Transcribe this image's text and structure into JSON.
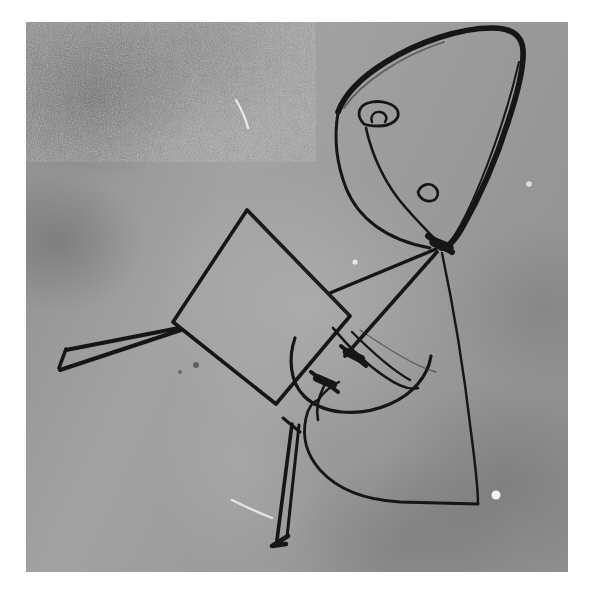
{
  "image": {
    "kind": "photograph",
    "subject": "abstract gestural line drawing of a figure",
    "medium": "black ink pen on paper, photographed in black and white",
    "width": 597,
    "height": 600,
    "paper_margin_color": "#ffffff",
    "print_area": {
      "x": 26,
      "y": 22,
      "width": 542,
      "height": 550
    },
    "background_tone": "#9a9a9a",
    "ink_color": "#111111",
    "texture": "heavy film grain / halftone stipple",
    "caption": ""
  },
  "strokes": {
    "head": {
      "name": "head-outline",
      "description": "large rounded triangular form, upper right"
    },
    "head_inner": {
      "name": "head-inner-contour",
      "description": "thin line following the inside of the head's right edge"
    },
    "eye_loop": {
      "name": "eye-loop",
      "description": "small closed loop inside the head, upper left"
    },
    "nose_loop": {
      "name": "nose-loop",
      "description": "tiny hooked loop on the lower cheek contour"
    },
    "cheek_curve": {
      "name": "cheek-curve",
      "description": "long sweeping curve from eye down to the neck junction"
    },
    "body": {
      "name": "body-quadrilateral",
      "description": "tilted four-sided slab occupying the centre"
    },
    "arm": {
      "name": "left-arm-wedge",
      "description": "narrow pointed wedge of two converging lines, to the lower left"
    },
    "leg": {
      "name": "lower-leg-wedge",
      "description": "narrow elongated wedge descending with a hooked foot"
    },
    "skirt": {
      "name": "skirt-contour",
      "description": "long right edge dropping to a rounded bottom shape"
    },
    "hand_arcs": {
      "name": "hand-arc-cluster",
      "description": "two crossing arcs with dense ink knots, lower centre"
    },
    "neck_node": {
      "name": "neck-junction-node",
      "description": "dense blot where five strokes converge below the head"
    }
  },
  "artifacts": {
    "scratches": [
      {
        "name": "white-scratch-upper",
        "note": "short bright emulsion scratch, upper centre"
      },
      {
        "name": "white-scratch-lower",
        "note": "bright scratch near the foot, lower left"
      }
    ],
    "specks": [
      {
        "name": "white-speck-right",
        "note": "bright speck on the lower right"
      },
      {
        "name": "white-speck-mid",
        "note": "bright speck beside the body slab"
      },
      {
        "name": "dark-speck-left",
        "note": "small dark fleck left of centre"
      }
    ]
  },
  "labels": {
    "title": "",
    "alt_text": "Grainy black-and-white photograph of an abstract ink line drawing"
  }
}
